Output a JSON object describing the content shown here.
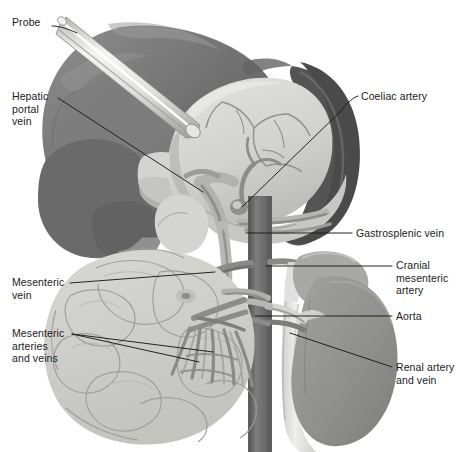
{
  "figure": {
    "width": 467,
    "height": 452,
    "background": "#ffffff"
  },
  "palette": {
    "background": "#ffffff",
    "liver_dark": "#6e6e6e",
    "liver_mid": "#8a8a8a",
    "liver_light": "#9b9b9b",
    "spleen_dark": "#585858",
    "stomach_light": "#d8d8d6",
    "stomach_shadow": "#c2c2c0",
    "intestine_light": "#cfcfcc",
    "intestine_outline": "#9a9a97",
    "kidney_mid": "#949492",
    "adrenal": "#aaaaa8",
    "aorta_dark": "#6f6f6f",
    "vena_cava_light": "#e2e2e0",
    "vessel_mid": "#7f7f7f",
    "vessel_light": "#b6b6b4",
    "probe_light": "#e8e8e6",
    "probe_edge": "#9d9d9b",
    "leader_line": "#1a1a1a",
    "label_text": "#1a1a1a"
  },
  "labels": [
    {
      "id": "probe",
      "text": "Probe",
      "side": "left",
      "x": 12,
      "y": 22,
      "lines": 1
    },
    {
      "id": "hepatic-portal-vein",
      "text": "Hepatic\nportal\nvein",
      "side": "left",
      "x": 12,
      "y": 92,
      "lines": 3
    },
    {
      "id": "mesenteric-vein",
      "text": "Mesenteric\nvein",
      "side": "left",
      "x": 12,
      "y": 278,
      "lines": 2
    },
    {
      "id": "mesenteric-arteries-and-veins",
      "text": "Mesenteric\narteries\nand veins",
      "side": "left",
      "x": 12,
      "y": 330,
      "lines": 3
    },
    {
      "id": "coeliac-artery",
      "text": "Coeliac artery",
      "side": "right",
      "x": 361,
      "y": 91,
      "lines": 1
    },
    {
      "id": "gastrosplenic-vein",
      "text": "Gastrosplenic vein",
      "side": "right",
      "x": 356,
      "y": 229,
      "lines": 1
    },
    {
      "id": "cranial-mesenteric-artery",
      "text": "Cranial\nmesenteric\nartery",
      "side": "right",
      "x": 396,
      "y": 261,
      "lines": 3
    },
    {
      "id": "aorta",
      "text": "Aorta",
      "side": "right",
      "x": 396,
      "y": 312,
      "lines": 1
    },
    {
      "id": "renal-artery-and-vein",
      "text": "Renal artery\nand vein",
      "side": "right",
      "x": 396,
      "y": 363,
      "lines": 2
    }
  ],
  "leaders": [
    {
      "id": "leader-probe",
      "from": [
        52,
        26
      ],
      "to": [
        77,
        33
      ]
    },
    {
      "id": "leader-hepatic-portal-vein",
      "from": [
        58,
        98
      ],
      "to": [
        203,
        192
      ]
    },
    {
      "id": "leader-mesenteric-vein",
      "from": [
        70,
        283
      ],
      "to": [
        215,
        272
      ]
    },
    {
      "id": "leader-mesenteric-av-1",
      "from": [
        72,
        334
      ],
      "to": [
        213,
        352
      ]
    },
    {
      "id": "leader-mesenteric-av-2",
      "from": [
        72,
        334
      ],
      "to": [
        199,
        362
      ]
    },
    {
      "id": "leader-coeliac-artery",
      "from": [
        358,
        96
      ],
      "to": [
        242,
        207
      ]
    },
    {
      "id": "leader-gastrosplenic-vein",
      "from": [
        352,
        233
      ],
      "to": [
        246,
        233
      ]
    },
    {
      "id": "leader-cranial-mesenteric",
      "from": [
        392,
        266
      ],
      "to": [
        266,
        266
      ]
    },
    {
      "id": "leader-aorta",
      "from": [
        392,
        316
      ],
      "to": [
        255,
        316
      ]
    },
    {
      "id": "leader-renal-artery-vein",
      "from": [
        392,
        367
      ],
      "to": [
        290,
        333
      ]
    }
  ],
  "structures": [
    {
      "id": "liver",
      "name": "Liver",
      "tone": "dark-grey"
    },
    {
      "id": "spleen",
      "name": "Spleen",
      "tone": "darkest-grey"
    },
    {
      "id": "stomach",
      "name": "Stomach",
      "tone": "light-grey"
    },
    {
      "id": "small-intestine",
      "name": "Small intestine coils",
      "tone": "pale-grey"
    },
    {
      "id": "kidney",
      "name": "Kidney",
      "tone": "mid-grey"
    },
    {
      "id": "adrenal-gland",
      "name": "Adrenal gland",
      "tone": "mid-light-grey"
    },
    {
      "id": "aorta-vessel",
      "name": "Aorta",
      "tone": "dark-grey"
    },
    {
      "id": "caudal-vena-cava",
      "name": "Caudal vena cava",
      "tone": "very-light-grey"
    },
    {
      "id": "probe-instrument",
      "name": "Surgical probe",
      "tone": "white-highlight"
    },
    {
      "id": "mesenteric-vessel-fan",
      "name": "Mesenteric arteries and veins",
      "tone": "mid-grey"
    }
  ]
}
